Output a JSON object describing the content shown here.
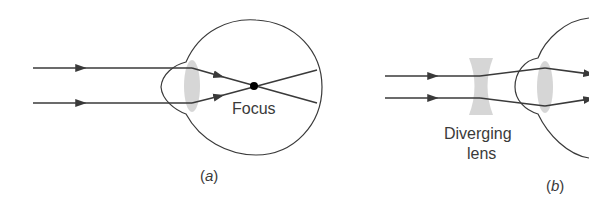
{
  "figure": {
    "colors": {
      "line": "#3a3a3a",
      "lens": "#cfcfcf",
      "focus_dot": "#000000",
      "background": "#ffffff"
    },
    "panels": [
      {
        "id": "a",
        "caption_open": "(",
        "caption_letter": "a",
        "caption_close": ")",
        "labels": {
          "focus": "Focus"
        }
      },
      {
        "id": "b",
        "caption_open": "(",
        "caption_letter": "b",
        "caption_close": ")",
        "labels": {
          "lens_line1": "Diverging",
          "lens_line2": "lens"
        }
      }
    ]
  }
}
